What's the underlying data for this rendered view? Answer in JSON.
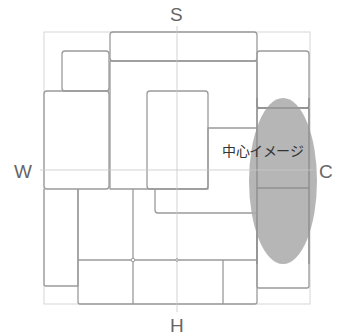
{
  "diagram": {
    "compass": {
      "top": "S",
      "bottom": "H",
      "left": "W",
      "right": "C"
    },
    "highlight_label": "中心イメージ",
    "colors": {
      "block_stroke": "#9a9a9a",
      "guide_stroke": "#d0d0d0",
      "highlight_fill": "#a9a9a9",
      "label_text": "#666666"
    }
  }
}
